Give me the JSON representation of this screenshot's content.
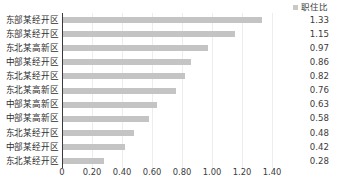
{
  "chart_data": {
    "type": "bar",
    "orientation": "horizontal",
    "title": "",
    "xlabel": "",
    "ylabel": "",
    "grid": true,
    "legend_position": "top-right",
    "legend": [
      "职住比"
    ],
    "series": [
      {
        "name": "职住比",
        "color": "#c4c4c4",
        "values": [
          1.33,
          1.15,
          0.97,
          0.86,
          0.82,
          0.76,
          0.63,
          0.58,
          0.48,
          0.42,
          0.28
        ]
      }
    ],
    "categories": [
      "东部某经开区",
      "东部某经开区",
      "东北某高新区",
      "中部某经开区",
      "东北某经开区",
      "东北某高新区",
      "中部某高新区",
      "中部某高新区",
      "东北某经开区",
      "中部某经开区",
      "东北某经开区"
    ],
    "value_labels": [
      "1.33",
      "1.15",
      "0.97",
      "0.86",
      "0.82",
      "0.76",
      "0.63",
      "0.58",
      "0.48",
      "0.42",
      "0.28"
    ],
    "xlim": [
      0,
      1.4
    ],
    "xticks": [
      0,
      0.2,
      0.4,
      0.6,
      0.8,
      1.0,
      1.2,
      1.4
    ],
    "xtick_labels": [
      "0",
      "0.20",
      "0.40",
      "0.60",
      "0.80",
      "1.00",
      "1.20",
      "1.40"
    ]
  },
  "colors": {
    "bar": "#c4c4c4",
    "gridline": "#ededed",
    "axis": "#3a3a3a",
    "text": "#3b3b3b"
  }
}
